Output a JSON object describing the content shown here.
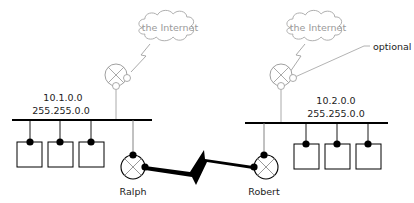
{
  "diagram": {
    "type": "network-topology",
    "clouds": [
      {
        "id": "internet-left",
        "label": "the Internet"
      },
      {
        "id": "internet-right",
        "label": "the Internet"
      }
    ],
    "annotation": {
      "label": "optional"
    },
    "networks": [
      {
        "id": "net-left",
        "address": "10.1.0.0",
        "mask": "255.255.0.0",
        "hosts": 3
      },
      {
        "id": "net-right",
        "address": "10.2.0.0",
        "mask": "255.255.0.0",
        "hosts": 3
      }
    ],
    "routers": [
      {
        "id": "ralph",
        "label": "Ralph"
      },
      {
        "id": "robert",
        "label": "Robert"
      }
    ],
    "links": [
      {
        "from": "ralph",
        "to": "robert",
        "type": "serial-wan"
      },
      {
        "from": "gateway-left",
        "to": "internet-left",
        "type": "serial-wan",
        "style": "grey"
      },
      {
        "from": "gateway-right",
        "to": "internet-right",
        "type": "serial-wan",
        "style": "grey",
        "note": "optional"
      }
    ],
    "colors": {
      "primary": "#000000",
      "secondary": "#9a9a9a",
      "background": "#ffffff"
    }
  }
}
